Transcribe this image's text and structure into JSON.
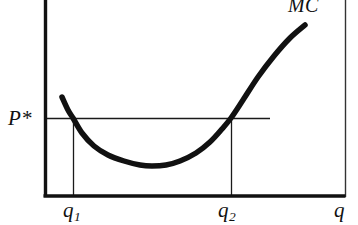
{
  "figure": {
    "background_color": "#ffffff",
    "ink_color": "#111111",
    "width": 358,
    "height": 225
  },
  "labels": {
    "price": "P*",
    "quantity_one": "q",
    "quantity_one_sub": "1",
    "quantity_two": "q",
    "quantity_two_sub": "2",
    "x_axis": "q",
    "curve": "MC"
  },
  "chart_data": {
    "type": "line",
    "title": "",
    "subtitle": "",
    "xlabel": "q",
    "ylabel": "",
    "grid": false,
    "legend": false,
    "axis_style": {
      "y_axis_x": 45,
      "x_axis_y": 196,
      "x_axis_end": 345,
      "y_axis_top": 0,
      "thick_stroke": 3,
      "thin_stroke": 1,
      "right_border_x": 345
    },
    "annotations": [
      {
        "name": "price-level-line",
        "label": "P*",
        "type": "horizontal-line",
        "y_px": 118,
        "x_start_px": 45,
        "x_end_px": 270,
        "stroke": 1
      },
      {
        "name": "q1-drop-line",
        "label": "q1",
        "type": "vertical-line",
        "x_px": 73,
        "y_start_px": 118,
        "y_end_px": 196,
        "stroke": 1
      },
      {
        "name": "q2-drop-line",
        "label": "q2",
        "type": "vertical-line",
        "x_px": 231,
        "y_start_px": 118,
        "y_end_px": 196,
        "stroke": 1
      }
    ],
    "series": [
      {
        "name": "MC",
        "label": "MC",
        "description": "U-shaped marginal cost curve",
        "stroke": 5.5,
        "color": "#111111",
        "points_px": [
          [
            62,
            97
          ],
          [
            68,
            110
          ],
          [
            73,
            118
          ],
          [
            82,
            133
          ],
          [
            94,
            146
          ],
          [
            108,
            155
          ],
          [
            124,
            161
          ],
          [
            140,
            165
          ],
          [
            152,
            166
          ],
          [
            166,
            165
          ],
          [
            180,
            161
          ],
          [
            196,
            153
          ],
          [
            210,
            142
          ],
          [
            222,
            129
          ],
          [
            231,
            118
          ],
          [
            243,
            100
          ],
          [
            258,
            77
          ],
          [
            274,
            56
          ],
          [
            290,
            38
          ],
          [
            305,
            25
          ]
        ],
        "minimum_px": [
          152,
          166
        ],
        "intersections_with_price_line_px": [
          [
            73,
            118
          ],
          [
            231,
            118
          ]
        ]
      }
    ]
  }
}
